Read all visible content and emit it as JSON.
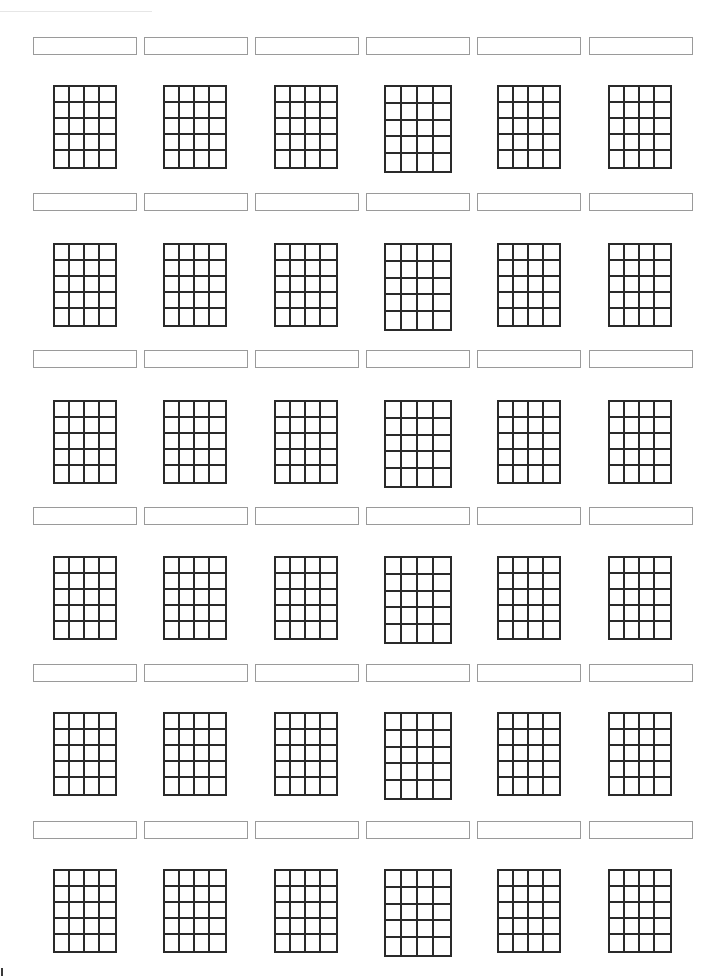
{
  "sheet": {
    "title": "",
    "grid_rows": 6,
    "grid_cols": 6,
    "chord_diagram": {
      "strings_columns": 4,
      "frets_rows": 5
    },
    "row_label_tops": [
      37,
      193,
      350,
      507,
      664,
      821
    ],
    "row_grid_tops": [
      85,
      243,
      400,
      556,
      712,
      869
    ],
    "col_label_lefts": [
      33,
      144,
      255,
      366,
      477,
      589
    ],
    "col_label_width": 104,
    "col_grid_lefts": [
      53,
      163,
      274,
      384,
      497,
      608
    ],
    "col_grid_widths": [
      64,
      64,
      64,
      68,
      64,
      64
    ],
    "grid_height": 84,
    "col4_grid_height": 88,
    "labels": [
      [
        "",
        "",
        "",
        "",
        "",
        ""
      ],
      [
        "",
        "",
        "",
        "",
        "",
        ""
      ],
      [
        "",
        "",
        "",
        "",
        "",
        ""
      ],
      [
        "",
        "",
        "",
        "",
        "",
        ""
      ],
      [
        "",
        "",
        "",
        "",
        "",
        ""
      ],
      [
        "",
        "",
        "",
        "",
        "",
        ""
      ]
    ],
    "colors": {
      "grid_line": "#2a2a2a",
      "label_border": "#9a9a9a",
      "background": "#ffffff"
    }
  }
}
